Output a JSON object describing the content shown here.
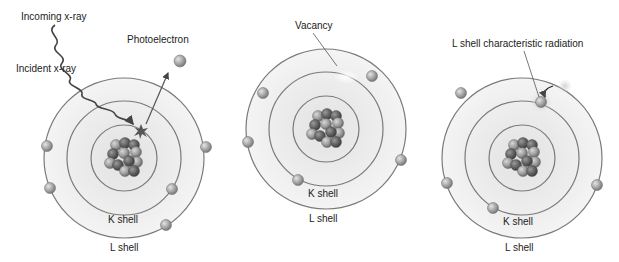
{
  "diagram": {
    "panels": [
      {
        "id": "photoelectric-absorption",
        "labels": {
          "incoming": "Incoming x-ray",
          "incident": "Incident x-ray",
          "photoelectron": "Photoelectron",
          "k_shell": "K shell",
          "l_shell": "L shell"
        }
      },
      {
        "id": "vacancy",
        "labels": {
          "vacancy": "Vacancy",
          "k_shell": "K shell",
          "l_shell": "L shell"
        }
      },
      {
        "id": "characteristic-radiation",
        "labels": {
          "radiation": "L shell characteristic radiation",
          "k_shell": "K shell",
          "l_shell": "L shell"
        }
      }
    ],
    "colors": {
      "orbit_line": "#7a7a7a",
      "atom_fill": "#ececec",
      "electron": "#a8a8a8",
      "proton": "#6e6e6e",
      "neutron": "#9c9c9c",
      "text": "#222222"
    }
  }
}
